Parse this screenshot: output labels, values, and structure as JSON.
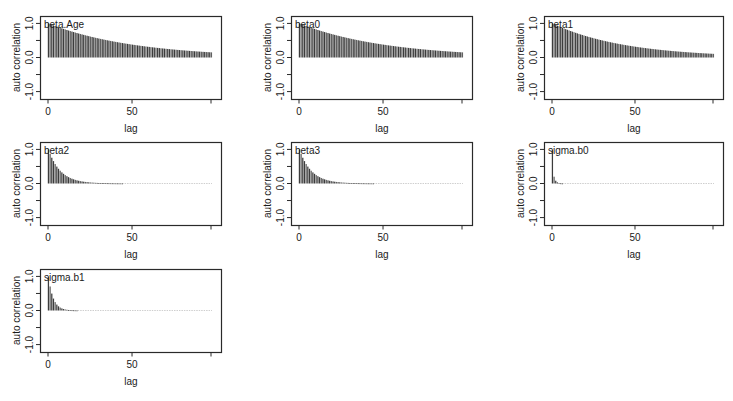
{
  "figure": {
    "width": 733,
    "height": 401,
    "frame_color": "#2a2a2a",
    "bar_color": "#2b2b2b",
    "text_color": "#1a1a1a"
  },
  "chart_data": [
    {
      "type": "bar",
      "title": "beta.Age",
      "xlabel": "lag",
      "ylabel": "auto correlation",
      "xticks": [
        0,
        50
      ],
      "yticks": [
        "-1.0",
        "0.0",
        "1.0"
      ],
      "ylim": [
        -1.1,
        1.1
      ],
      "xlim": [
        0,
        97
      ],
      "decay": {
        "model": "exp",
        "rate": 0.0195,
        "floor": 0.0
      },
      "panel": {
        "left": 40,
        "top": 16,
        "width": 181,
        "height": 83
      },
      "sample_values": {
        "0": 1.0,
        "25": 0.61,
        "50": 0.38,
        "75": 0.23,
        "97": 0.15
      }
    },
    {
      "type": "bar",
      "title": "beta0",
      "xlabel": "lag",
      "ylabel": "auto correlation",
      "xticks": [
        0,
        50
      ],
      "yticks": [
        "-1.0",
        "0.0",
        "1.0"
      ],
      "ylim": [
        -1.1,
        1.1
      ],
      "xlim": [
        0,
        97
      ],
      "decay": {
        "model": "exp",
        "rate": 0.0195,
        "floor": 0.0
      },
      "panel": {
        "left": 291,
        "top": 16,
        "width": 181,
        "height": 83
      },
      "sample_values": {
        "0": 1.0,
        "25": 0.61,
        "50": 0.38,
        "75": 0.23,
        "97": 0.15
      }
    },
    {
      "type": "bar",
      "title": "beta1",
      "xlabel": "lag",
      "ylabel": "auto correlation",
      "xticks": [
        0,
        50
      ],
      "yticks": [
        "-1.0",
        "0.0",
        "1.0"
      ],
      "ylim": [
        -1.1,
        1.1
      ],
      "xlim": [
        0,
        97
      ],
      "decay": {
        "model": "exp",
        "rate": 0.023,
        "floor": 0.0
      },
      "panel": {
        "left": 544,
        "top": 16,
        "width": 179,
        "height": 83
      },
      "sample_values": {
        "0": 1.0,
        "25": 0.56,
        "50": 0.32,
        "75": 0.18,
        "97": 0.11
      }
    },
    {
      "type": "bar",
      "title": "beta2",
      "xlabel": "lag",
      "ylabel": "auto correlation",
      "xticks": [
        0,
        50
      ],
      "yticks": [
        "-1.0",
        "0.0",
        "1.0"
      ],
      "ylim": [
        -1.1,
        1.1
      ],
      "xlim": [
        0,
        97
      ],
      "decay": {
        "model": "exp",
        "rate": 0.14,
        "floor": 0.0
      },
      "panel": {
        "left": 40,
        "top": 142,
        "width": 181,
        "height": 83
      },
      "sample_values": {
        "0": 1.0,
        "10": 0.25,
        "20": 0.06,
        "30": 0.02,
        "97": 0.0
      }
    },
    {
      "type": "bar",
      "title": "beta3",
      "xlabel": "lag",
      "ylabel": "auto correlation",
      "xticks": [
        0,
        50
      ],
      "yticks": [
        "-1.0",
        "0.0",
        "1.0"
      ],
      "ylim": [
        -1.1,
        1.1
      ],
      "xlim": [
        0,
        97
      ],
      "decay": {
        "model": "exp",
        "rate": 0.14,
        "floor": 0.0
      },
      "panel": {
        "left": 291,
        "top": 142,
        "width": 181,
        "height": 83
      },
      "sample_values": {
        "0": 1.0,
        "10": 0.25,
        "20": 0.06,
        "30": 0.02,
        "97": 0.0
      }
    },
    {
      "type": "bar",
      "title": "sigma.b0",
      "xlabel": "lag",
      "ylabel": "auto correlation",
      "xticks": [
        0,
        50
      ],
      "yticks": [
        "-1.0",
        "0.0",
        "1.0"
      ],
      "ylim": [
        -1.1,
        1.1
      ],
      "xlim": [
        0,
        97
      ],
      "decay": {
        "model": "spike",
        "rate": 0.9,
        "floor": 0.0
      },
      "panel": {
        "left": 544,
        "top": 142,
        "width": 179,
        "height": 83
      },
      "sample_values": {
        "0": 1.0,
        "1": 0.2,
        "2": 0.1,
        "5": 0.04,
        "97": 0.0
      }
    },
    {
      "type": "bar",
      "title": "sigma.b1",
      "xlabel": "lag",
      "ylabel": "auto correlation",
      "xticks": [
        0,
        50
      ],
      "yticks": [
        "-1.0",
        "0.0",
        "1.0"
      ],
      "ylim": [
        -1.1,
        1.1
      ],
      "xlim": [
        0,
        97
      ],
      "decay": {
        "model": "exp",
        "rate": 0.35,
        "floor": 0.0
      },
      "panel": {
        "left": 40,
        "top": 269,
        "width": 181,
        "height": 83
      },
      "sample_values": {
        "0": 1.0,
        "3": 0.35,
        "5": 0.17,
        "10": 0.03,
        "97": 0.0
      }
    }
  ]
}
